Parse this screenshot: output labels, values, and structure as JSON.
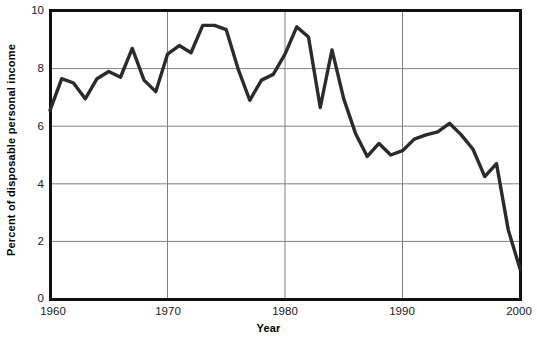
{
  "chart_data": {
    "type": "line",
    "title": "",
    "xlabel": "Year",
    "ylabel": "Percent of disposable personal income",
    "xlim": [
      1960,
      2000
    ],
    "ylim": [
      0,
      10
    ],
    "xticks": [
      1960,
      1970,
      1980,
      1990,
      2000
    ],
    "yticks": [
      0,
      2,
      4,
      6,
      8,
      10
    ],
    "grid": true,
    "legend": null,
    "series": [
      {
        "name": "Personal saving rate",
        "color": "#2b2b2b",
        "x": [
          1960,
          1961,
          1962,
          1963,
          1964,
          1965,
          1966,
          1967,
          1968,
          1969,
          1970,
          1971,
          1972,
          1973,
          1974,
          1975,
          1976,
          1977,
          1978,
          1979,
          1980,
          1981,
          1982,
          1983,
          1984,
          1985,
          1986,
          1987,
          1988,
          1989,
          1990,
          1991,
          1992,
          1993,
          1994,
          1995,
          1996,
          1997,
          1998,
          1999,
          2000
        ],
        "values": [
          6.55,
          7.65,
          7.5,
          6.95,
          7.65,
          7.9,
          7.7,
          8.7,
          7.6,
          7.2,
          8.5,
          8.8,
          8.55,
          9.5,
          9.5,
          9.35,
          8.0,
          6.9,
          7.6,
          7.8,
          8.5,
          9.45,
          9.1,
          6.65,
          8.65,
          6.95,
          5.75,
          4.95,
          5.4,
          5.0,
          5.15,
          5.55,
          5.7,
          5.8,
          6.1,
          5.7,
          5.2,
          4.25,
          4.7,
          2.4,
          1.05
        ]
      }
    ]
  },
  "axis": {
    "ylabel": "Percent of disposable personal income",
    "xlabel": "Year",
    "yticks": [
      "10",
      "8",
      "6",
      "4",
      "2",
      "0"
    ],
    "xticks": [
      "1960",
      "1970",
      "1980",
      "1990",
      "2000"
    ]
  },
  "style": {
    "line_color": "#2b2b2b",
    "grid_color": "#808080",
    "frame_color": "#111111",
    "background": "#ffffff"
  }
}
